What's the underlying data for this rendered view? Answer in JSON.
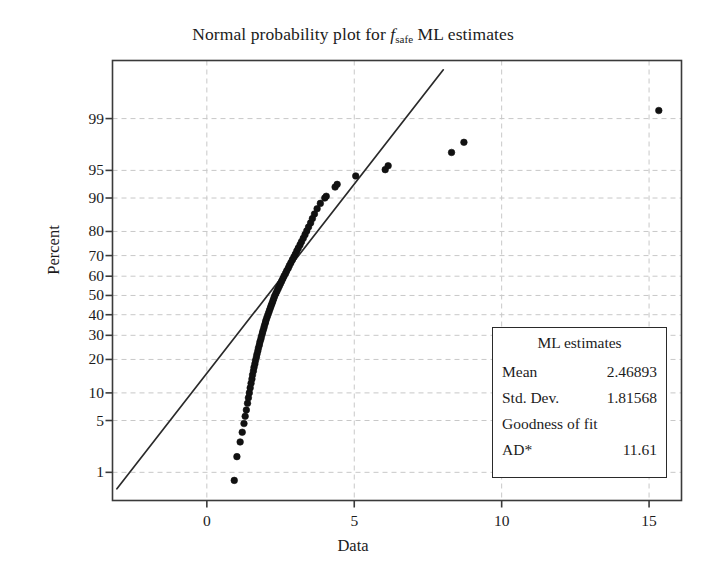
{
  "chart_data": {
    "type": "scatter",
    "title_parts": {
      "prefix": "Normal probability plot for ",
      "var_italic": "f",
      "var_subscript": "safe",
      "suffix": " ML estimates"
    },
    "xlabel": "Data",
    "ylabel": "Percent",
    "xlim": [
      -3.2,
      16.1
    ],
    "ylim_percent": [
      0.35,
      99.9
    ],
    "yscale": "normal-probability",
    "xticks": [
      0,
      5,
      10,
      15
    ],
    "xtick_labels": [
      "0",
      "5",
      "10",
      "15"
    ],
    "yticks": [
      1,
      5,
      10,
      20,
      30,
      40,
      50,
      60,
      70,
      80,
      90,
      95,
      99
    ],
    "ytick_labels": [
      "1",
      "5",
      "10",
      "20",
      "30",
      "40",
      "50",
      "60",
      "70",
      "80",
      "90",
      "95",
      "99"
    ],
    "grid": true,
    "grid_style": "dashed",
    "grid_color": "#c8c8c8",
    "marker": "filled-circle",
    "marker_color": "#111111",
    "fit_line": {
      "label": "normal ML fit line",
      "color": "#2a2a2a",
      "x_start": -3.05,
      "x_end": 8.02,
      "percent_start": 0.55,
      "percent_end": 99.85
    },
    "points": [
      {
        "x": 0.93,
        "p": 0.75
      },
      {
        "x": 1.02,
        "p": 1.7
      },
      {
        "x": 1.13,
        "p": 2.7
      },
      {
        "x": 1.2,
        "p": 3.6
      },
      {
        "x": 1.26,
        "p": 4.6
      },
      {
        "x": 1.3,
        "p": 5.6
      },
      {
        "x": 1.34,
        "p": 6.6
      },
      {
        "x": 1.38,
        "p": 7.8
      },
      {
        "x": 1.41,
        "p": 8.9
      },
      {
        "x": 1.44,
        "p": 10.0
      },
      {
        "x": 1.47,
        "p": 11.2
      },
      {
        "x": 1.5,
        "p": 12.4
      },
      {
        "x": 1.53,
        "p": 13.6
      },
      {
        "x": 1.55,
        "p": 14.8
      },
      {
        "x": 1.58,
        "p": 16.0
      },
      {
        "x": 1.6,
        "p": 17.2
      },
      {
        "x": 1.63,
        "p": 18.4
      },
      {
        "x": 1.65,
        "p": 19.6
      },
      {
        "x": 1.68,
        "p": 20.8
      },
      {
        "x": 1.7,
        "p": 22.0
      },
      {
        "x": 1.73,
        "p": 23.3
      },
      {
        "x": 1.75,
        "p": 24.5
      },
      {
        "x": 1.78,
        "p": 25.7
      },
      {
        "x": 1.8,
        "p": 27.0
      },
      {
        "x": 1.83,
        "p": 28.2
      },
      {
        "x": 1.85,
        "p": 29.4
      },
      {
        "x": 1.88,
        "p": 30.7
      },
      {
        "x": 1.9,
        "p": 31.9
      },
      {
        "x": 1.93,
        "p": 33.2
      },
      {
        "x": 1.95,
        "p": 34.4
      },
      {
        "x": 1.98,
        "p": 35.7
      },
      {
        "x": 2.0,
        "p": 36.9
      },
      {
        "x": 2.03,
        "p": 38.2
      },
      {
        "x": 2.06,
        "p": 39.5
      },
      {
        "x": 2.09,
        "p": 40.7
      },
      {
        "x": 2.12,
        "p": 42.0
      },
      {
        "x": 2.15,
        "p": 43.3
      },
      {
        "x": 2.18,
        "p": 44.6
      },
      {
        "x": 2.21,
        "p": 45.8
      },
      {
        "x": 2.24,
        "p": 47.1
      },
      {
        "x": 2.27,
        "p": 48.4
      },
      {
        "x": 2.3,
        "p": 49.7
      },
      {
        "x": 2.34,
        "p": 51.0
      },
      {
        "x": 2.38,
        "p": 52.3
      },
      {
        "x": 2.42,
        "p": 53.6
      },
      {
        "x": 2.46,
        "p": 54.9
      },
      {
        "x": 2.5,
        "p": 56.2
      },
      {
        "x": 2.54,
        "p": 57.5
      },
      {
        "x": 2.58,
        "p": 58.8
      },
      {
        "x": 2.62,
        "p": 60.1
      },
      {
        "x": 2.67,
        "p": 61.4
      },
      {
        "x": 2.71,
        "p": 62.7
      },
      {
        "x": 2.76,
        "p": 64.0
      },
      {
        "x": 2.8,
        "p": 65.3
      },
      {
        "x": 2.85,
        "p": 66.6
      },
      {
        "x": 2.9,
        "p": 68.0
      },
      {
        "x": 2.95,
        "p": 69.3
      },
      {
        "x": 3.0,
        "p": 70.6
      },
      {
        "x": 3.05,
        "p": 72.0
      },
      {
        "x": 3.1,
        "p": 73.3
      },
      {
        "x": 3.16,
        "p": 74.7
      },
      {
        "x": 3.21,
        "p": 76.0
      },
      {
        "x": 3.27,
        "p": 77.4
      },
      {
        "x": 3.33,
        "p": 78.8
      },
      {
        "x": 3.39,
        "p": 80.2
      },
      {
        "x": 3.45,
        "p": 81.6
      },
      {
        "x": 3.52,
        "p": 83.0
      },
      {
        "x": 3.58,
        "p": 84.4
      },
      {
        "x": 3.65,
        "p": 85.8
      },
      {
        "x": 3.74,
        "p": 87.3
      },
      {
        "x": 3.85,
        "p": 88.7
      },
      {
        "x": 4.0,
        "p": 90.0
      },
      {
        "x": 4.05,
        "p": 90.4
      },
      {
        "x": 4.35,
        "p": 92.3
      },
      {
        "x": 4.42,
        "p": 92.8
      },
      {
        "x": 5.05,
        "p": 94.2
      },
      {
        "x": 6.05,
        "p": 95.1
      },
      {
        "x": 6.15,
        "p": 95.6
      },
      {
        "x": 8.3,
        "p": 97.0
      },
      {
        "x": 8.72,
        "p": 97.8
      },
      {
        "x": 15.33,
        "p": 99.25
      }
    ]
  },
  "legend": {
    "title": "ML estimates",
    "rows": [
      {
        "key": "Mean",
        "value": "2.46893"
      },
      {
        "key": "Std. Dev.",
        "value": "1.81568"
      }
    ],
    "gof_label": "Goodness of fit",
    "ad_key": "AD*",
    "ad_value": "11.61"
  }
}
